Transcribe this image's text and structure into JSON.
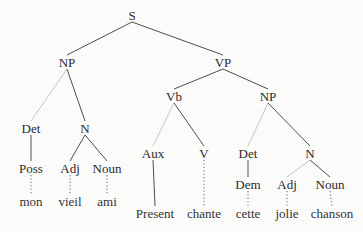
{
  "diagram": {
    "type": "parse-tree",
    "colors": {
      "ink": "#2a2a2a",
      "line": "#3a3a3a",
      "faint_line": "#b8b8b8",
      "background": "#fbfbfa"
    },
    "nodes": {
      "S": {
        "label": "S",
        "x": 132,
        "y": 15
      },
      "NP1": {
        "label": "NP",
        "x": 67,
        "y": 62
      },
      "VP": {
        "label": "VP",
        "x": 223,
        "y": 62
      },
      "Det1": {
        "label": "Det",
        "x": 31,
        "y": 128
      },
      "N1": {
        "label": "N",
        "x": 85,
        "y": 128
      },
      "Poss": {
        "label": "Poss",
        "x": 31,
        "y": 168
      },
      "Adj1": {
        "label": "Adj",
        "x": 70,
        "y": 168
      },
      "Noun1": {
        "label": "Noun",
        "x": 107,
        "y": 168
      },
      "mon": {
        "label": "mon",
        "x": 31,
        "y": 201
      },
      "vieil": {
        "label": "vieil",
        "x": 70,
        "y": 201
      },
      "ami": {
        "label": "ami",
        "x": 107,
        "y": 201
      },
      "Vb": {
        "label": "Vb",
        "x": 174,
        "y": 96
      },
      "NP2": {
        "label": "NP",
        "x": 268,
        "y": 96
      },
      "Aux": {
        "label": "Aux",
        "x": 153,
        "y": 153
      },
      "V": {
        "label": "V",
        "x": 204,
        "y": 153
      },
      "Det2": {
        "label": "Det",
        "x": 248,
        "y": 153
      },
      "N2": {
        "label": "N",
        "x": 310,
        "y": 153
      },
      "Dem": {
        "label": "Dem",
        "x": 248,
        "y": 184
      },
      "Adj2": {
        "label": "Adj",
        "x": 287,
        "y": 184
      },
      "Noun2": {
        "label": "Noun",
        "x": 330,
        "y": 184
      },
      "Present": {
        "label": "Present",
        "x": 155,
        "y": 213
      },
      "chante": {
        "label": "chante",
        "x": 204,
        "y": 213
      },
      "cette": {
        "label": "cette",
        "x": 248,
        "y": 213
      },
      "jolie": {
        "label": "jolie",
        "x": 287,
        "y": 213
      },
      "chanson": {
        "label": "chanson",
        "x": 332,
        "y": 213
      }
    },
    "edges": [
      {
        "from": "S",
        "to": "NP1",
        "style": "solid"
      },
      {
        "from": "S",
        "to": "VP",
        "style": "solid"
      },
      {
        "from": "NP1",
        "to": "Det1",
        "style": "faint"
      },
      {
        "from": "NP1",
        "to": "N1",
        "style": "solid"
      },
      {
        "from": "Det1",
        "to": "Poss",
        "style": "solid"
      },
      {
        "from": "N1",
        "to": "Adj1",
        "style": "solid"
      },
      {
        "from": "N1",
        "to": "Noun1",
        "style": "solid"
      },
      {
        "from": "Poss",
        "to": "mon",
        "style": "dotted"
      },
      {
        "from": "Adj1",
        "to": "vieil",
        "style": "dotted"
      },
      {
        "from": "Noun1",
        "to": "ami",
        "style": "dotted"
      },
      {
        "from": "VP",
        "to": "Vb",
        "style": "solid"
      },
      {
        "from": "VP",
        "to": "NP2",
        "style": "solid"
      },
      {
        "from": "Vb",
        "to": "Aux",
        "style": "faint"
      },
      {
        "from": "Vb",
        "to": "V",
        "style": "solid"
      },
      {
        "from": "NP2",
        "to": "Det2",
        "style": "faint"
      },
      {
        "from": "NP2",
        "to": "N2",
        "style": "solid"
      },
      {
        "from": "Aux",
        "to": "Present",
        "style": "solid"
      },
      {
        "from": "V",
        "to": "chante",
        "style": "dotted"
      },
      {
        "from": "Det2",
        "to": "Dem",
        "style": "solid"
      },
      {
        "from": "N2",
        "to": "Adj2",
        "style": "faint"
      },
      {
        "from": "N2",
        "to": "Noun2",
        "style": "solid"
      },
      {
        "from": "Dem",
        "to": "cette",
        "style": "dotted"
      },
      {
        "from": "Adj2",
        "to": "jolie",
        "style": "dotted"
      },
      {
        "from": "Noun2",
        "to": "chanson",
        "style": "dotted"
      }
    ]
  }
}
